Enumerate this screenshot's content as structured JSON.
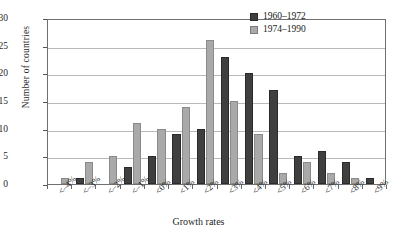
{
  "chart_data": {
    "type": "bar",
    "title": "",
    "xlabel": "Growth rates",
    "ylabel": "Number of countries",
    "categories": [
      "<–4%",
      "<–3%",
      "<–2%",
      "<–1%",
      "<0%",
      "<1%",
      "<2%",
      "<3%",
      "<4%",
      "<5%",
      "<6%",
      "<7%",
      "<8%",
      "<9%"
    ],
    "series": [
      {
        "name": "1960–1972",
        "color": "#3f3f3f",
        "values": [
          0,
          1,
          0,
          3,
          5,
          9,
          10,
          23,
          20,
          17,
          5,
          6,
          4,
          1
        ]
      },
      {
        "name": "1974–1990",
        "color": "#a9a9a9",
        "values": [
          1,
          4,
          5,
          11,
          10,
          14,
          26,
          15,
          9,
          2,
          4,
          2,
          1,
          0
        ]
      }
    ],
    "ylim": [
      0,
      30
    ],
    "yticks": [
      0,
      5,
      10,
      15,
      20,
      25,
      30
    ],
    "ytick_labels": [
      "0",
      "5",
      "10",
      "15",
      "20",
      "25",
      "30"
    ],
    "grid": "horizontal",
    "legend_position": "top-right"
  },
  "axes": {
    "y_title": "Number of countries",
    "x_title": "Growth rates"
  },
  "legend": {
    "items": [
      {
        "label": "1960–1972",
        "swatch": "dark"
      },
      {
        "label": "1974–1990",
        "swatch": "light"
      }
    ]
  }
}
